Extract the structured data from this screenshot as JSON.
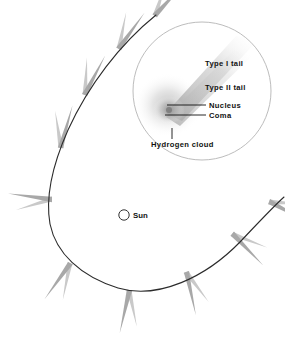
{
  "figure": {
    "type": "diagram",
    "background_color": "#ffffff",
    "orbit_color": "#2b2b2b",
    "tail_color": "#a8a8a8",
    "tail_color_light": "#c9c9c9",
    "inset_border_color": "#b4b4b4",
    "label_color": "#111111"
  },
  "sun": {
    "label": "Sun",
    "marker": "open-circle",
    "cx": 124,
    "cy": 215,
    "r": 5.2
  },
  "orbit": {
    "name": "comet-orbit-path",
    "stroke_width": 1.1
  },
  "comet_markers": [
    {
      "id": 1,
      "x": 155,
      "y": 16,
      "angle": -55
    },
    {
      "id": 2,
      "x": 119,
      "y": 49,
      "angle": -62
    },
    {
      "id": 3,
      "x": 85,
      "y": 95,
      "angle": -70
    },
    {
      "id": 4,
      "x": 61,
      "y": 148,
      "angle": -82
    },
    {
      "id": 5,
      "x": 52,
      "y": 199,
      "angle": 180
    },
    {
      "id": 6,
      "x": 70,
      "y": 263,
      "angle": 118
    },
    {
      "id": 7,
      "x": 129,
      "y": 290,
      "angle": 95
    },
    {
      "id": 8,
      "x": 186,
      "y": 272,
      "angle": 70
    },
    {
      "id": 9,
      "x": 232,
      "y": 234,
      "angle": 38
    },
    {
      "id": 10,
      "x": 269,
      "y": 202,
      "angle": 20
    }
  ],
  "inset": {
    "name": "magnified-comet-detail",
    "cx": 202,
    "cy": 91,
    "r": 69,
    "labels": [
      {
        "key": "type_i_tail",
        "text": "Type I tail",
        "x": 205,
        "y": 66
      },
      {
        "key": "type_ii_tail",
        "text": "Type II tail",
        "x": 205,
        "y": 90
      },
      {
        "key": "nucleus",
        "text": "Nucleus",
        "x": 209,
        "y": 108
      },
      {
        "key": "coma",
        "text": "Coma",
        "x": 209,
        "y": 118
      },
      {
        "key": "hydrogen_cloud",
        "text": "Hydrogen cloud",
        "x": 151,
        "y": 147
      }
    ],
    "leader_lines": [
      {
        "key": "nucleus-leader",
        "x1": 167,
        "y1": 105,
        "x2": 206,
        "y2": 105
      },
      {
        "key": "coma-leader",
        "x1": 165,
        "y1": 115,
        "x2": 206,
        "y2": 115
      },
      {
        "key": "hydrogen-leader",
        "x1": 172,
        "y1": 128,
        "x2": 172,
        "y2": 139
      }
    ]
  }
}
